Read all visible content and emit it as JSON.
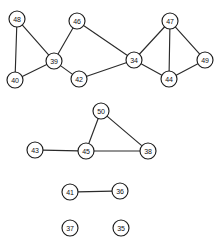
{
  "graph": {
    "title": "undirected node-link graph",
    "node_radius": 8,
    "node_fill": "#ffffff",
    "node_stroke": "#1c1c1c",
    "edge_color": "#2b2b2b",
    "background": "#ffffff",
    "nodes": [
      {
        "id": "48",
        "label": "48",
        "x": 17,
        "y": 19
      },
      {
        "id": "46",
        "label": "46",
        "x": 77,
        "y": 21
      },
      {
        "id": "47",
        "label": "47",
        "x": 170,
        "y": 21
      },
      {
        "id": "39",
        "label": "39",
        "x": 54,
        "y": 61
      },
      {
        "id": "34",
        "label": "34",
        "x": 134,
        "y": 60
      },
      {
        "id": "49",
        "label": "49",
        "x": 205,
        "y": 60
      },
      {
        "id": "40",
        "label": "40",
        "x": 15,
        "y": 80
      },
      {
        "id": "42",
        "label": "42",
        "x": 79,
        "y": 79
      },
      {
        "id": "44",
        "label": "44",
        "x": 169,
        "y": 79
      },
      {
        "id": "50",
        "label": "50",
        "x": 101,
        "y": 111
      },
      {
        "id": "43",
        "label": "43",
        "x": 35,
        "y": 150
      },
      {
        "id": "45",
        "label": "45",
        "x": 86,
        "y": 151
      },
      {
        "id": "38",
        "label": "38",
        "x": 148,
        "y": 151
      },
      {
        "id": "41",
        "label": "41",
        "x": 70,
        "y": 192
      },
      {
        "id": "36",
        "label": "36",
        "x": 120,
        "y": 191
      },
      {
        "id": "37",
        "label": "37",
        "x": 70,
        "y": 228
      },
      {
        "id": "35",
        "label": "35",
        "x": 121,
        "y": 228
      }
    ],
    "edges": [
      {
        "source": "48",
        "target": "40"
      },
      {
        "source": "48",
        "target": "39"
      },
      {
        "source": "40",
        "target": "39"
      },
      {
        "source": "39",
        "target": "46"
      },
      {
        "source": "39",
        "target": "42"
      },
      {
        "source": "46",
        "target": "34"
      },
      {
        "source": "42",
        "target": "34"
      },
      {
        "source": "34",
        "target": "47"
      },
      {
        "source": "34",
        "target": "44"
      },
      {
        "source": "47",
        "target": "44"
      },
      {
        "source": "47",
        "target": "49"
      },
      {
        "source": "44",
        "target": "49"
      },
      {
        "source": "50",
        "target": "45"
      },
      {
        "source": "50",
        "target": "38"
      },
      {
        "source": "43",
        "target": "45"
      },
      {
        "source": "45",
        "target": "38"
      },
      {
        "source": "41",
        "target": "36"
      }
    ]
  }
}
